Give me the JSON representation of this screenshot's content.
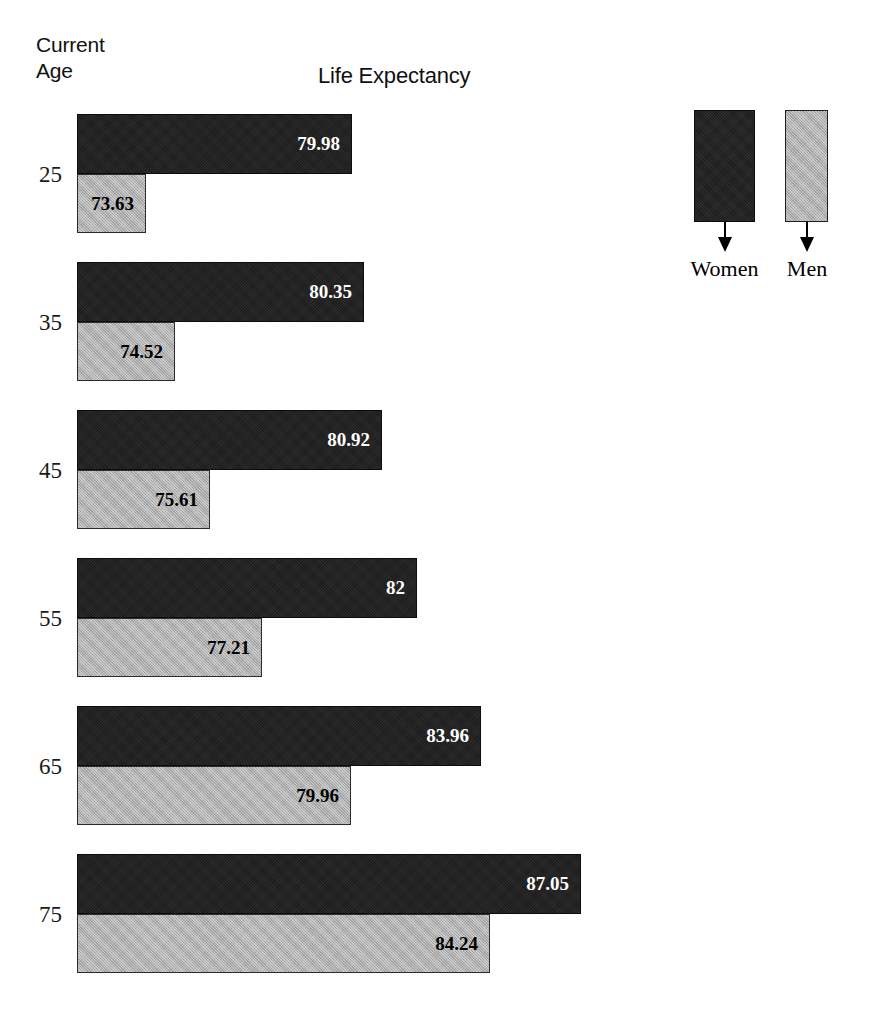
{
  "header": {
    "current_label": "Current",
    "age_label": "Age",
    "title": "Life Expectancy"
  },
  "legend": {
    "items": [
      {
        "label": "Women",
        "color": "#1b1b1b",
        "icon": "down-arrow-icon"
      },
      {
        "label": "Men",
        "color": "#adadad",
        "icon": "down-arrow-icon"
      }
    ]
  },
  "chart_data": {
    "type": "bar",
    "orientation": "horizontal",
    "title": "Life Expectancy",
    "xlabel": "Life Expectancy",
    "ylabel": "Current Age",
    "categories": [
      "25",
      "35",
      "45",
      "55",
      "65",
      "75"
    ],
    "series": [
      {
        "name": "Women",
        "color": "#1b1b1b",
        "values": [
          79.98,
          80.35,
          80.92,
          82,
          83.96,
          87.05
        ],
        "labels": [
          "79.98",
          "80.35",
          "80.92",
          "82",
          "83.96",
          "87.05"
        ]
      },
      {
        "name": "Men",
        "color": "#adadad",
        "values": [
          73.63,
          74.52,
          75.61,
          77.21,
          79.96,
          84.24
        ],
        "labels": [
          "73.63",
          "74.52",
          "75.61",
          "77.21",
          "79.96",
          "84.24"
        ]
      }
    ],
    "xlim": [
      71.5,
      88.5
    ],
    "grid": false,
    "legend_position": "top-right",
    "axis_visible": false
  }
}
